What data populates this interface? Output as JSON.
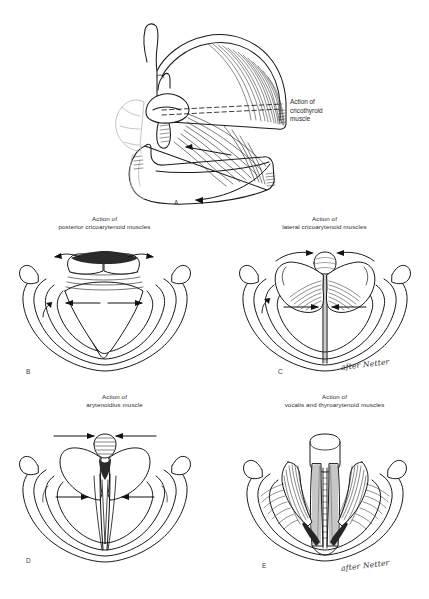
{
  "document": {
    "top_fragment": "",
    "attribution": "after Netter",
    "background_color": "#ffffff",
    "ink_color": "#1a1a1a"
  },
  "figure": {
    "kind": "anatomical-line-art",
    "panel_count": 5
  },
  "panels": [
    {
      "letter": "A",
      "caption": "",
      "side_label": "Action of\ncricothyroid\nmuscle",
      "view": "lateral view of laryngeal cartilages",
      "attribution": "",
      "arrows": [
        "downward-tilt-arrow",
        "anterior-traction-arrow"
      ]
    },
    {
      "letter": "B",
      "caption": "Action of\nposterior cricoarytenoid muscles",
      "side_label": "",
      "view": "superior laryngoscopic view, glottis abducted",
      "attribution": "",
      "arrows": [
        "outward-lateral-arrows",
        "posterior-rotation-arrows"
      ]
    },
    {
      "letter": "C",
      "caption": "Action of\nlateral cricoarytenoid muscles",
      "side_label": "",
      "view": "superior laryngoscopic view, glottis adducted",
      "attribution": "after Netter",
      "arrows": [
        "inward-medial-arrows",
        "anterior-rotation-arrows"
      ]
    },
    {
      "letter": "D",
      "caption": "Action of\narytenoidius muscle",
      "side_label": "",
      "view": "superior laryngoscopic view, arytenoid approximation",
      "attribution": "",
      "arrows": [
        "converging-medial-arrows",
        "top-approximation-arrows"
      ]
    },
    {
      "letter": "E",
      "caption": "Action of\nvocalis and thyroarytenoid muscles",
      "side_label": "",
      "view": "superior laryngoscopic view, vocal cord shortening",
      "attribution": "after Netter",
      "arrows": []
    }
  ]
}
